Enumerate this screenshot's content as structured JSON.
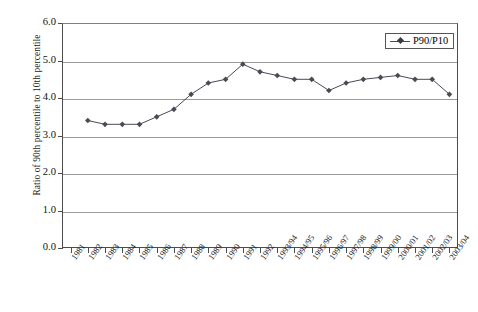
{
  "chart_data": {
    "type": "line",
    "title": "",
    "xlabel": "",
    "ylabel": "Ratio of 90th percentile to 10th percentile",
    "ylim": [
      0.0,
      6.0
    ],
    "ytick_labels": [
      "6.0",
      "5.0",
      "4.0",
      "3.0",
      "2.0",
      "1.0",
      "0.0"
    ],
    "ytick_values": [
      6.0,
      5.0,
      4.0,
      3.0,
      2.0,
      1.0,
      0.0
    ],
    "grid": true,
    "legend_position": "top-right",
    "categories": [
      "1981",
      "1982",
      "1983",
      "1984",
      "1985",
      "1986",
      "1987",
      "1988",
      "1989",
      "1990",
      "1991",
      "1992",
      "1993/94",
      "1994/95",
      "1995/96",
      "1996/97",
      "1997/98",
      "1998/99",
      "1999/00",
      "2000/01",
      "2001/02",
      "2002/03",
      "2003/04"
    ],
    "series": [
      {
        "name": "P90/P10",
        "marker": "diamond",
        "color": "#4a4a55",
        "values": [
          null,
          3.4,
          3.3,
          3.3,
          3.3,
          3.5,
          3.7,
          4.1,
          4.4,
          4.5,
          4.9,
          4.7,
          4.6,
          4.5,
          4.5,
          4.2,
          4.4,
          4.5,
          4.55,
          4.6,
          4.5,
          4.5,
          4.1
        ]
      }
    ]
  },
  "legend": {
    "entries": [
      {
        "label": "P90/P10"
      }
    ]
  }
}
